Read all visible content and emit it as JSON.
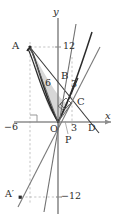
{
  "figure": {
    "type": "cartesian-geometry-diagram",
    "axes": {
      "x_axis_label": "x",
      "y_axis_label": "y",
      "origin_label": "O"
    },
    "tick_labels": {
      "x_negative_six": "−6",
      "x_three": "3",
      "y_twelve": "12",
      "y_negative_twelve": "−12"
    },
    "points": {
      "a": "A",
      "a_prime": "A′",
      "b": "B",
      "c": "C",
      "d": "D",
      "p": "P",
      "o": "O"
    },
    "segment_labels": {
      "six": "6",
      "three": "3"
    },
    "colors": {
      "curve_dark": "#2b2b2b",
      "axis_gray": "#8d8d8d",
      "line_gray": "#7a7a7a",
      "shade_fill": "#c9c9c9",
      "dash_gray": "#b4b4b4",
      "background": "#ffffff"
    },
    "geometry": {
      "point_A": [
        -6,
        12
      ],
      "point_A_prime": [
        -6,
        -12
      ],
      "point_C": [
        3,
        3
      ],
      "origin": [
        0,
        0
      ],
      "x_range": [
        -7,
        12
      ],
      "y_range": [
        -14,
        16
      ]
    }
  }
}
